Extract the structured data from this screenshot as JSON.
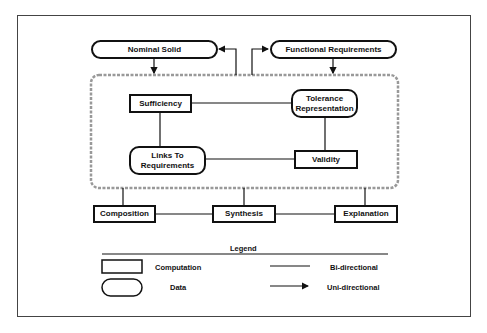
{
  "diagram": {
    "data_nodes": {
      "nominal_solid": "Nominal Solid",
      "functional_requirements": "Functional Requirements",
      "tolerance_representation": "Tolerance Representation",
      "links_to_requirements": "Links To Requirements"
    },
    "computation_nodes": {
      "sufficiency": "Sufficiency",
      "validity": "Validity",
      "composition": "Composition",
      "synthesis": "Synthesis",
      "explanation": "Explanation"
    },
    "edges": [
      {
        "from": "Nominal Solid",
        "to": "dashed-region",
        "type": "uni-directional"
      },
      {
        "from": "dashed-region",
        "to": "Nominal Solid",
        "type": "uni-directional"
      },
      {
        "from": "dashed-region",
        "to": "Functional Requirements",
        "type": "uni-directional"
      },
      {
        "from": "Functional Requirements",
        "to": "dashed-region",
        "type": "uni-directional"
      },
      {
        "from": "Sufficiency",
        "to": "Tolerance Representation",
        "type": "bi-directional"
      },
      {
        "from": "Sufficiency",
        "to": "Links To Requirements",
        "type": "bi-directional"
      },
      {
        "from": "Tolerance Representation",
        "to": "Validity",
        "type": "bi-directional"
      },
      {
        "from": "Links To Requirements",
        "to": "Validity",
        "type": "bi-directional"
      },
      {
        "from": "dashed-region",
        "to": "Composition",
        "type": "bi-directional"
      },
      {
        "from": "dashed-region",
        "to": "Synthesis",
        "type": "bi-directional"
      },
      {
        "from": "dashed-region",
        "to": "Explanation",
        "type": "bi-directional"
      },
      {
        "from": "Composition",
        "to": "Synthesis",
        "type": "bi-directional"
      },
      {
        "from": "Synthesis",
        "to": "Explanation",
        "type": "bi-directional"
      }
    ]
  },
  "legend": {
    "title": "Legend",
    "computation_label": "Computation",
    "data_label": "Data",
    "bidirectional_label": "Bi-directional",
    "unidirectional_label": "Uni-directional"
  }
}
